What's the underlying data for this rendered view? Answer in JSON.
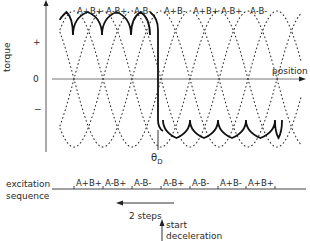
{
  "axes": {
    "y_label": "torque",
    "y_ticks": [
      "+",
      "0",
      "−"
    ],
    "x_label": "position"
  },
  "top_phase_labels": [
    "A+B+",
    "A-B+",
    "A-B-",
    "A+B-",
    "A+B+",
    "A-B+",
    "A-B-"
  ],
  "marker": {
    "label": "θ",
    "subscript": "D"
  },
  "excitation": {
    "label_line1": "excitation",
    "label_line2": "sequence",
    "steps": [
      "A+B+",
      "A-B+",
      "A-B-",
      "A-B+",
      "A-B-",
      "A+B-",
      "A+B+"
    ]
  },
  "annotations": {
    "steps_back": "2 steps",
    "start_line1": "start",
    "start_line2": "deceleration"
  },
  "colors": {
    "ink": "#222222",
    "axis": "#555555",
    "background": "#ffffff"
  }
}
